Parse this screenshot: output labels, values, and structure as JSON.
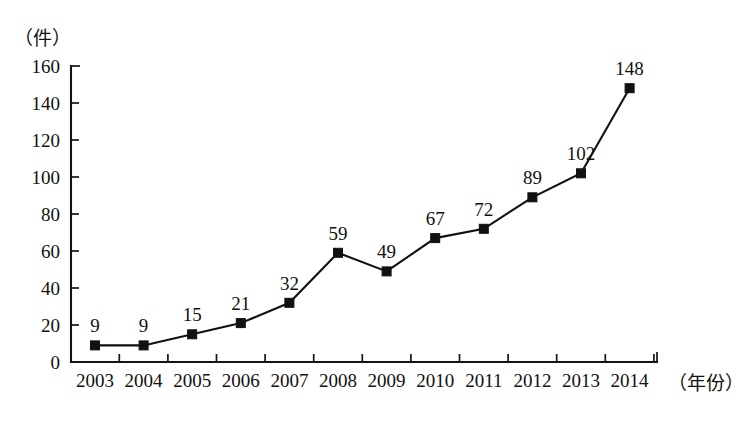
{
  "chart_data": {
    "type": "line",
    "title": "",
    "subtitle": "",
    "xlabel": "（年份）",
    "ylabel": "（件）",
    "categories": [
      "2003",
      "2004",
      "2005",
      "2006",
      "2007",
      "2008",
      "2009",
      "2010",
      "2011",
      "2012",
      "2013",
      "2014"
    ],
    "values": [
      9,
      9,
      15,
      21,
      32,
      59,
      49,
      67,
      72,
      89,
      102,
      148
    ],
    "series": [
      {
        "name": "件数",
        "values": [
          9,
          9,
          15,
          21,
          32,
          59,
          49,
          67,
          72,
          89,
          102,
          148
        ]
      }
    ],
    "point_labels": [
      "9",
      "9",
      "15",
      "21",
      "32",
      "59",
      "49",
      "67",
      "72",
      "89",
      "102",
      "148"
    ],
    "ylim": [
      0,
      160
    ],
    "ytick_values": [
      0,
      20,
      40,
      60,
      80,
      100,
      120,
      140,
      160
    ],
    "ytick_labels": [
      "0",
      "20",
      "40",
      "60",
      "80",
      "100",
      "120",
      "140",
      "160"
    ],
    "grid": false,
    "legend": false,
    "legend_position": "none",
    "marker": "square",
    "line_color": "#111111",
    "marker_color": "#111111",
    "axis_color": "#141414",
    "background_color": "#ffffff"
  },
  "axes": {
    "y_unit_label": "（件）",
    "x_unit_label": "（年份）"
  }
}
